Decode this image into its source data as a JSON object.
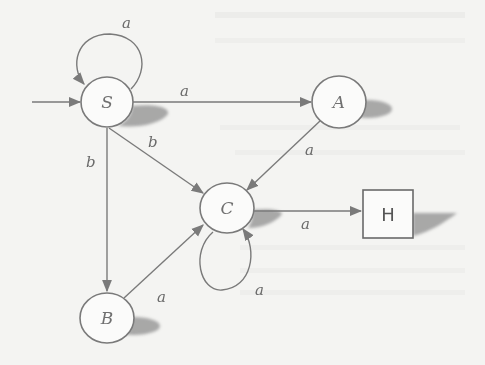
{
  "diagram": {
    "type": "finite-automaton",
    "start_state": "S",
    "nodes": [
      {
        "id": "S",
        "label": "S",
        "shape": "circle",
        "start": true
      },
      {
        "id": "A",
        "label": "A",
        "shape": "circle"
      },
      {
        "id": "B",
        "label": "B",
        "shape": "circle"
      },
      {
        "id": "C",
        "label": "C",
        "shape": "circle"
      },
      {
        "id": "H",
        "label": "H",
        "shape": "box",
        "final": true
      }
    ],
    "edges": [
      {
        "from": "S",
        "to": "S",
        "label": "a"
      },
      {
        "from": "S",
        "to": "A",
        "label": "a"
      },
      {
        "from": "S",
        "to": "C",
        "label": "b"
      },
      {
        "from": "S",
        "to": "B",
        "label": "b"
      },
      {
        "from": "A",
        "to": "C",
        "label": "a"
      },
      {
        "from": "B",
        "to": "C",
        "label": "a"
      },
      {
        "from": "C",
        "to": "C",
        "label": "a"
      },
      {
        "from": "C",
        "to": "H",
        "label": "a"
      }
    ]
  },
  "colors": {
    "stroke": "#7a7a7a",
    "shadow": "#9a9a9a",
    "background": "#f4f4f2"
  }
}
